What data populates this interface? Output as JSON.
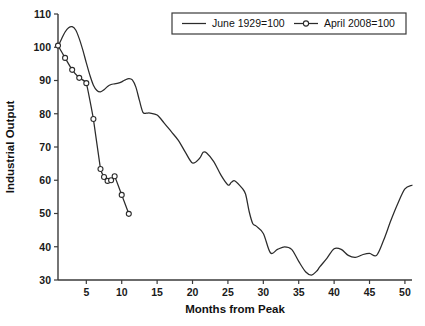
{
  "chart_data": {
    "type": "line",
    "title": "",
    "xlabel": "Months from Peak",
    "ylabel": "Industrial Output",
    "xlim": [
      1,
      51
    ],
    "ylim": [
      30,
      110
    ],
    "xticks": [
      5,
      10,
      15,
      20,
      25,
      30,
      35,
      40,
      45,
      50
    ],
    "yticks": [
      30,
      40,
      50,
      60,
      70,
      80,
      90,
      100,
      110
    ],
    "xtick_labels": [
      "5",
      "10",
      "15",
      "20",
      "25",
      "30",
      "35",
      "40",
      "45",
      "50"
    ],
    "ytick_labels": [
      "30",
      "40",
      "50",
      "60",
      "70",
      "80",
      "90",
      "100",
      "110"
    ],
    "grid": false,
    "legend_position": "top-right",
    "line_color": "#2b2b2b",
    "background_color": "#ffffff",
    "series": [
      {
        "name": "June 1929=100",
        "marker": "none",
        "style": "solid",
        "x": [
          1,
          1.5,
          2,
          2.5,
          3,
          3.5,
          4,
          4.5,
          5,
          5.5,
          6,
          6.5,
          7,
          7.5,
          8,
          8.5,
          9,
          9.5,
          10,
          10.5,
          11,
          11.5,
          12,
          12.5,
          13,
          13.5,
          14,
          15,
          16,
          17,
          18,
          19,
          20,
          21,
          21.5,
          22,
          23,
          24,
          25,
          25.5,
          26,
          27,
          27.5,
          28,
          28.5,
          29,
          30,
          31,
          32,
          33,
          34,
          35,
          36,
          36.8,
          37.5,
          38,
          39,
          40,
          41,
          42,
          43,
          44,
          45,
          46,
          47,
          48,
          49,
          50,
          51
        ],
        "y": [
          100.2,
          102.5,
          104.6,
          105.9,
          106.2,
          105.2,
          102.6,
          99.2,
          95.3,
          91.6,
          88.6,
          87.0,
          86.6,
          87.2,
          88.2,
          88.8,
          89.0,
          89.2,
          89.6,
          90.2,
          90.6,
          90.2,
          88.0,
          84.0,
          80.4,
          80.2,
          80.2,
          79.6,
          77.2,
          74.6,
          72.0,
          68.4,
          65.2,
          66.6,
          68.4,
          68.2,
          65.6,
          61.6,
          58.6,
          59.4,
          59.8,
          57.6,
          55.8,
          50.6,
          47.0,
          46.2,
          44.0,
          38.2,
          39.2,
          40.0,
          39.2,
          35.6,
          32.4,
          31.5,
          32.6,
          34.0,
          36.6,
          39.4,
          39.2,
          37.4,
          36.8,
          37.6,
          38.0,
          37.4,
          42.0,
          47.8,
          53.0,
          57.4,
          58.5
        ]
      },
      {
        "name": "April 2008=100",
        "marker": "circle-open",
        "style": "solid",
        "x": [
          1,
          2,
          3,
          4,
          5,
          6,
          7,
          7.5,
          8,
          8.5,
          9,
          10,
          11
        ],
        "y": [
          100.5,
          96.8,
          93.2,
          90.8,
          89.2,
          78.4,
          63.4,
          61.0,
          59.8,
          60.0,
          61.2,
          55.6,
          49.9
        ]
      }
    ],
    "legend": [
      {
        "label": "June 1929=100",
        "marker": "none"
      },
      {
        "label": "April 2008=100",
        "marker": "circle-open"
      }
    ]
  }
}
